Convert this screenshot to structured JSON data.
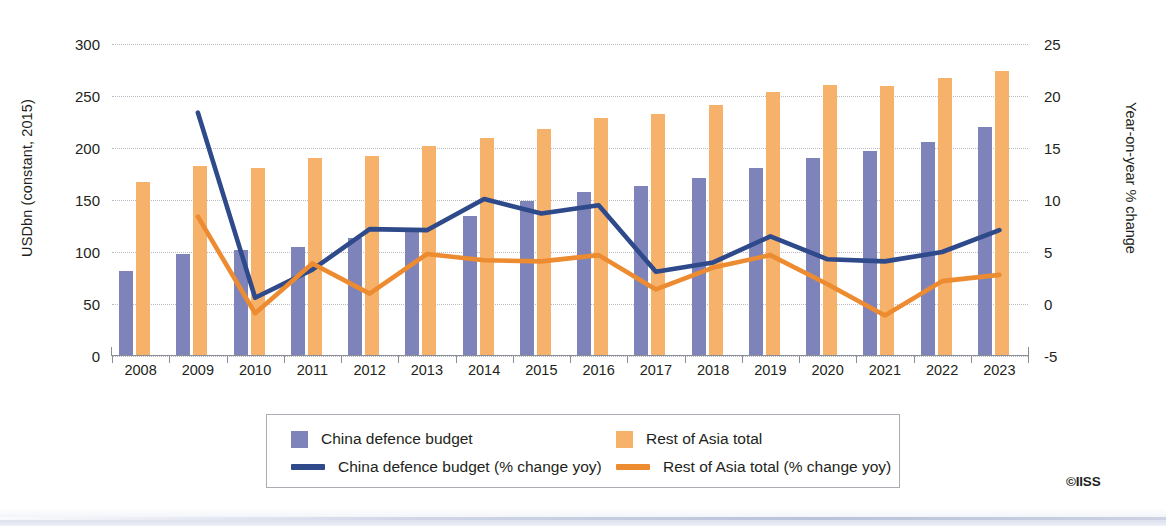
{
  "chart_data": {
    "type": "bar",
    "title": "",
    "subtitle": "",
    "xlabel": "",
    "ylabel": "USDbn (constant, 2015)",
    "ylabel_right": "Year-on-year % change",
    "categories": [
      "2008",
      "2009",
      "2010",
      "2011",
      "2012",
      "2013",
      "2014",
      "2015",
      "2016",
      "2017",
      "2018",
      "2019",
      "2020",
      "2021",
      "2022",
      "2023"
    ],
    "ylim": [
      0,
      300
    ],
    "yticks": [
      "0",
      "50",
      "100",
      "150",
      "200",
      "250",
      "300"
    ],
    "ylim_right": [
      -5,
      25
    ],
    "yticks_right": [
      "-5",
      "0",
      "5",
      "10",
      "15",
      "20",
      "25"
    ],
    "grid": true,
    "legend_position": "bottom",
    "series": [
      {
        "name": "China defence budget",
        "type": "bar",
        "axis": "left",
        "color": "#7e84ba",
        "values": [
          82,
          98,
          102,
          105,
          113,
          122,
          135,
          149,
          158,
          163,
          171,
          181,
          190,
          197,
          206,
          220
        ]
      },
      {
        "name": "Rest of Asia total",
        "type": "bar",
        "axis": "left",
        "color": "#f6b26b",
        "values": [
          167,
          183,
          181,
          190,
          192,
          202,
          210,
          218,
          229,
          233,
          241,
          254,
          261,
          260,
          267,
          274
        ]
      },
      {
        "name": "China defence budget (% change yoy)",
        "type": "line",
        "axis": "right",
        "color": "#2e4a8a",
        "values": [
          null,
          18.4,
          0.6,
          3.3,
          7.2,
          7.1,
          10.1,
          8.7,
          9.5,
          3.1,
          4.0,
          6.5,
          4.3,
          4.1,
          5.0,
          7.1
        ]
      },
      {
        "name": "Rest of Asia total (% change yoy)",
        "type": "line",
        "axis": "right",
        "color": "#ed8b31",
        "values": [
          null,
          8.4,
          -0.9,
          3.9,
          1.0,
          4.8,
          4.2,
          4.1,
          4.7,
          1.4,
          3.5,
          4.7,
          1.9,
          -1.1,
          2.2,
          2.8
        ]
      }
    ]
  },
  "legend": {
    "items": [
      {
        "label": "China defence budget",
        "marker": "box",
        "color": "#7e84ba"
      },
      {
        "label": "Rest of Asia total",
        "marker": "box",
        "color": "#f6b26b"
      },
      {
        "label": "China defence budget (% change yoy)",
        "marker": "line",
        "color": "#2e4a8a"
      },
      {
        "label": "Rest of Asia total (% change yoy)",
        "marker": "line",
        "color": "#ed8b31"
      }
    ]
  },
  "credit": "©IISS"
}
